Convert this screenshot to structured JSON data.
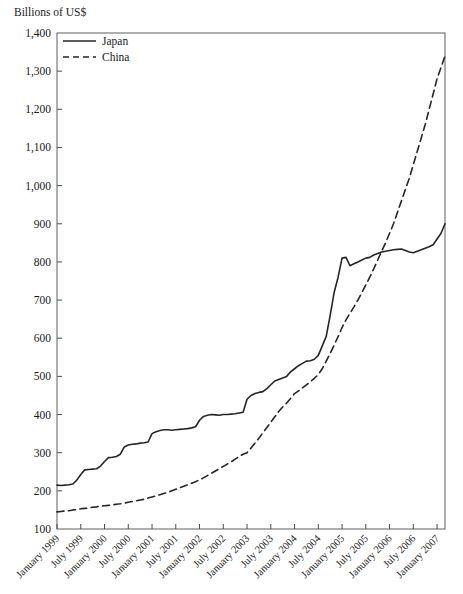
{
  "chart_data": {
    "type": "line",
    "title": "Billions of US$",
    "xlabel": "",
    "ylabel": "Billions of US$",
    "ylim": [
      100,
      1400
    ],
    "ytick_step": 100,
    "ytick_labels": [
      "100",
      "200",
      "300",
      "400",
      "500",
      "600",
      "700",
      "800",
      "900",
      "1,000",
      "1,100",
      "1,200",
      "1,300",
      "1,400"
    ],
    "grid": false,
    "legend_position": "top-left",
    "x_tick_labels": [
      "January 1999",
      "July 1999",
      "January 2000",
      "July 2000",
      "January 2001",
      "July 2001",
      "January 2002",
      "July 2002",
      "January 2003",
      "July 2003",
      "January 2004",
      "July 2004",
      "January 2005",
      "July 2005",
      "January 2006",
      "July 2006",
      "January 2007"
    ],
    "x_start_months": 0,
    "x_end_months": 98,
    "series": [
      {
        "name": "Japan",
        "style": "solid",
        "color": "#262626",
        "x_months": [
          0,
          1,
          2,
          3,
          4,
          5,
          6,
          7,
          8,
          9,
          10,
          11,
          12,
          13,
          14,
          15,
          16,
          17,
          18,
          19,
          20,
          21,
          22,
          23,
          24,
          25,
          26,
          27,
          28,
          29,
          30,
          31,
          32,
          33,
          34,
          35,
          36,
          37,
          38,
          39,
          40,
          41,
          42,
          43,
          44,
          45,
          46,
          47,
          48,
          49,
          50,
          51,
          52,
          53,
          54,
          55,
          56,
          57,
          58,
          59,
          60,
          61,
          62,
          63,
          64,
          65,
          66,
          67,
          68,
          69,
          70,
          71,
          72,
          73,
          74,
          75,
          76,
          77,
          78,
          79,
          80,
          81,
          82,
          83,
          84,
          85,
          86,
          87,
          88,
          89,
          90,
          91,
          92,
          93,
          94,
          95,
          96,
          97,
          98
        ],
        "values": [
          215,
          214,
          215,
          216,
          218,
          228,
          243,
          255,
          256,
          257,
          258,
          265,
          277,
          287,
          288,
          290,
          296,
          315,
          320,
          322,
          323,
          325,
          326,
          328,
          350,
          355,
          358,
          360,
          360,
          359,
          360,
          361,
          362,
          363,
          365,
          368,
          385,
          395,
          398,
          400,
          399,
          398,
          400,
          400,
          401,
          402,
          404,
          406,
          440,
          450,
          455,
          458,
          460,
          468,
          478,
          488,
          492,
          496,
          500,
          512,
          520,
          528,
          534,
          540,
          541,
          545,
          555,
          580,
          605,
          660,
          720,
          760,
          810,
          812,
          790,
          795,
          800,
          805,
          810,
          812,
          818,
          822,
          826,
          828,
          830,
          832,
          833,
          834,
          830,
          826,
          824,
          828,
          832,
          836,
          840,
          845,
          860,
          875,
          900
        ]
      },
      {
        "name": "China",
        "style": "dashed",
        "color": "#262626",
        "x_months": [
          0,
          1,
          2,
          3,
          4,
          5,
          6,
          7,
          8,
          9,
          10,
          11,
          12,
          13,
          14,
          15,
          16,
          17,
          18,
          19,
          20,
          21,
          22,
          23,
          24,
          25,
          26,
          27,
          28,
          29,
          30,
          31,
          32,
          33,
          34,
          35,
          36,
          37,
          38,
          39,
          40,
          41,
          42,
          43,
          44,
          45,
          46,
          47,
          48,
          49,
          50,
          51,
          52,
          53,
          54,
          55,
          56,
          57,
          58,
          59,
          60,
          61,
          62,
          63,
          64,
          65,
          66,
          67,
          68,
          69,
          70,
          71,
          72,
          73,
          74,
          75,
          76,
          77,
          78,
          79,
          80,
          81,
          82,
          83,
          84,
          85,
          86,
          87,
          88,
          89,
          90,
          91,
          92,
          93,
          94,
          95,
          96,
          97,
          98
        ],
        "values": [
          145,
          146,
          147,
          148,
          150,
          151,
          153,
          154,
          155,
          157,
          158,
          160,
          161,
          162,
          163,
          165,
          166,
          168,
          170,
          172,
          174,
          176,
          178,
          181,
          184,
          187,
          190,
          193,
          196,
          200,
          204,
          208,
          212,
          216,
          220,
          224,
          229,
          234,
          240,
          246,
          252,
          258,
          264,
          270,
          276,
          283,
          290,
          296,
          300,
          312,
          325,
          338,
          352,
          366,
          380,
          394,
          408,
          420,
          430,
          442,
          455,
          462,
          470,
          478,
          486,
          495,
          505,
          520,
          540,
          560,
          582,
          604,
          628,
          648,
          665,
          682,
          700,
          720,
          740,
          760,
          782,
          805,
          828,
          850,
          875,
          900,
          930,
          960,
          990,
          1020,
          1055,
          1090,
          1125,
          1160,
          1200,
          1240,
          1280,
          1310,
          1340
        ]
      }
    ]
  },
  "legend": {
    "items": [
      {
        "label": "Japan",
        "style": "solid"
      },
      {
        "label": "China",
        "style": "dashed"
      }
    ]
  }
}
